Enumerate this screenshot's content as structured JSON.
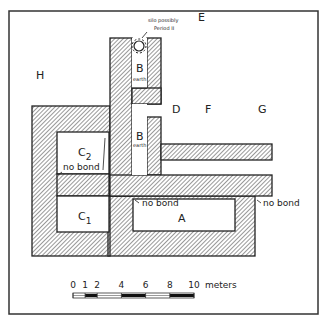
{
  "figure": {
    "type": "archaeological site plan",
    "rooms": [
      {
        "id": "H",
        "label": "H"
      },
      {
        "id": "E",
        "label": "E"
      },
      {
        "id": "D",
        "label": "D"
      },
      {
        "id": "F",
        "label": "F"
      },
      {
        "id": "G",
        "label": "G"
      },
      {
        "id": "B_upper",
        "label": "B",
        "note": "earth"
      },
      {
        "id": "B_lower",
        "label": "B",
        "note": "earth"
      },
      {
        "id": "C2",
        "label": "C",
        "subscript": "2"
      },
      {
        "id": "C1",
        "label": "C",
        "subscript": "1"
      },
      {
        "id": "A",
        "label": "A"
      }
    ],
    "annotations": {
      "silo_line1": "silo possibly",
      "silo_line2": "Period II",
      "no_bond_c2": "no bond",
      "no_bond_a_left": "no bond",
      "no_bond_a_right": "no bond"
    }
  },
  "scale_bar": {
    "ticks": [
      "0",
      "1",
      "2",
      "4",
      "6",
      "8",
      "10"
    ],
    "unit": "meters",
    "max_value": 10,
    "filled_segments": [
      [
        1,
        2
      ],
      [
        4,
        6
      ],
      [
        8,
        10
      ]
    ]
  }
}
